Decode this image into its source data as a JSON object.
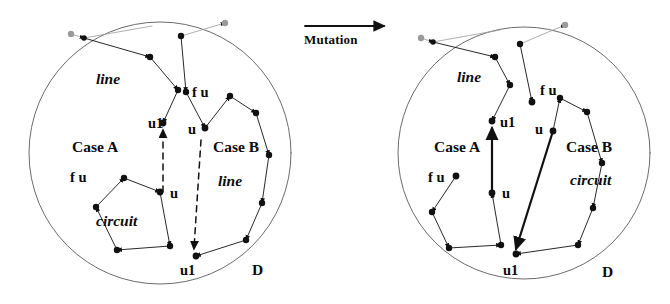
{
  "figure": {
    "title_arrow_label": "Mutation",
    "arrow_icon": "right-arrow-icon",
    "ink_color": "#111111",
    "faded_color": "#8b8b8b",
    "background": "#ffffff"
  },
  "panels": [
    {
      "id": "before",
      "name": "before-mutation-panel",
      "domain_label": "D",
      "circle": {
        "cx": 160,
        "cy": 153,
        "r": 131
      },
      "labels": [
        {
          "key": "line_top",
          "text": "line",
          "style": "italic",
          "x": 96,
          "y": 80
        },
        {
          "key": "case_a",
          "text": "Case A",
          "style": "bold",
          "x": 72,
          "y": 150
        },
        {
          "key": "fu_a",
          "text": "f u",
          "style": "bold",
          "x": 70,
          "y": 180
        },
        {
          "key": "circuit_a",
          "text": "circuit",
          "style": "italic",
          "x": 96,
          "y": 223
        },
        {
          "key": "u1_a",
          "text": "u1",
          "style": "bold",
          "x": 148,
          "y": 127
        },
        {
          "key": "u_a",
          "text": "u",
          "style": "bold",
          "x": 151,
          "y": 196
        },
        {
          "key": "fu_b",
          "text": "f u",
          "style": "bold",
          "x": 192,
          "y": 95
        },
        {
          "key": "u_b",
          "text": "u",
          "style": "bold",
          "x": 185,
          "y": 132
        },
        {
          "key": "case_b",
          "text": "Case B",
          "style": "bold",
          "x": 215,
          "y": 150
        },
        {
          "key": "line_b",
          "text": "line",
          "style": "italic",
          "x": 218,
          "y": 183
        },
        {
          "key": "u1_b",
          "text": "u1",
          "style": "bold",
          "x": 182,
          "y": 267
        },
        {
          "key": "domain",
          "text": "D",
          "style": "bold",
          "x": 253,
          "y": 270
        }
      ],
      "case_a_state": "circuit",
      "case_b_state": "line"
    },
    {
      "id": "after",
      "name": "after-mutation-panel",
      "domain_label": "D",
      "circle": {
        "cx": 524,
        "cy": 153,
        "r": 126
      },
      "labels": [
        {
          "key": "line_top",
          "text": "line",
          "style": "italic",
          "x": 457,
          "y": 78
        },
        {
          "key": "case_a",
          "text": "Case A",
          "style": "bold",
          "x": 436,
          "y": 150
        },
        {
          "key": "fu_a",
          "text": "f u",
          "style": "bold",
          "x": 429,
          "y": 180
        },
        {
          "key": "u1_a",
          "text": "u1",
          "style": "bold",
          "x": 500,
          "y": 126
        },
        {
          "key": "u_a",
          "text": "u",
          "style": "bold",
          "x": 502,
          "y": 196
        },
        {
          "key": "fu_b",
          "text": "f u",
          "style": "bold",
          "x": 523,
          "y": 92
        },
        {
          "key": "u_b",
          "text": "u",
          "style": "bold",
          "x": 538,
          "y": 132
        },
        {
          "key": "case_b",
          "text": "Case B",
          "style": "bold",
          "x": 568,
          "y": 150
        },
        {
          "key": "circuit_b",
          "text": "circuit",
          "style": "italic",
          "x": 571,
          "y": 182
        },
        {
          "key": "u1_b",
          "text": "u1",
          "style": "bold",
          "x": 505,
          "y": 268
        },
        {
          "key": "domain",
          "text": "D",
          "style": "bold",
          "x": 603,
          "y": 272
        }
      ],
      "case_a_state": "line",
      "case_b_state": "circuit"
    }
  ]
}
